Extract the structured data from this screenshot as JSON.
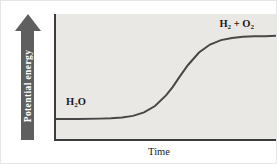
{
  "figure": {
    "y_axis_label": "Potential energy",
    "x_axis_label": "Time",
    "labels": {
      "reactant": {
        "b1": "H",
        "s1": "2",
        "b2": "O"
      },
      "product": {
        "b1": "H",
        "s1": "2",
        "b2": " + O",
        "s2": "2"
      }
    },
    "colors": {
      "plot_bg": "#e9e8e4",
      "axis": "#3d3d3d",
      "curve": "#474747",
      "arrow": "#5f5f5f",
      "arrow_text": "#ffffff",
      "label_text": "#1b1b1b"
    }
  },
  "chart_data": {
    "type": "line",
    "title": "",
    "xlabel": "Time",
    "ylabel": "Potential energy",
    "x_ticks": [],
    "y_ticks": [],
    "axis_note": "qualitative axes, no numeric scale shown; y-axis drawn as upward gray arrow",
    "legend": "none",
    "grid": false,
    "series": [
      {
        "name": "system potential energy (sigmoid rise from H2O to H2 + O2)",
        "x": [
          0,
          0.1,
          0.2,
          0.25,
          0.3,
          0.35,
          0.4,
          0.45,
          0.5,
          0.53,
          0.56,
          0.6,
          0.65,
          0.7,
          0.75,
          0.8,
          0.85,
          0.9,
          0.95,
          1
        ],
        "y": [
          0.16,
          0.16,
          0.163,
          0.166,
          0.172,
          0.185,
          0.213,
          0.264,
          0.349,
          0.415,
          0.493,
          0.592,
          0.692,
          0.756,
          0.791,
          0.809,
          0.817,
          0.821,
          0.823,
          0.825
        ]
      }
    ],
    "annotations": [
      {
        "text": "H₂O",
        "position": "above low plateau, left",
        "x": 0.06,
        "y": 0.28
      },
      {
        "text": "H₂ + O₂",
        "position": "above high plateau, right",
        "x": 0.8,
        "y": 0.93
      }
    ]
  }
}
